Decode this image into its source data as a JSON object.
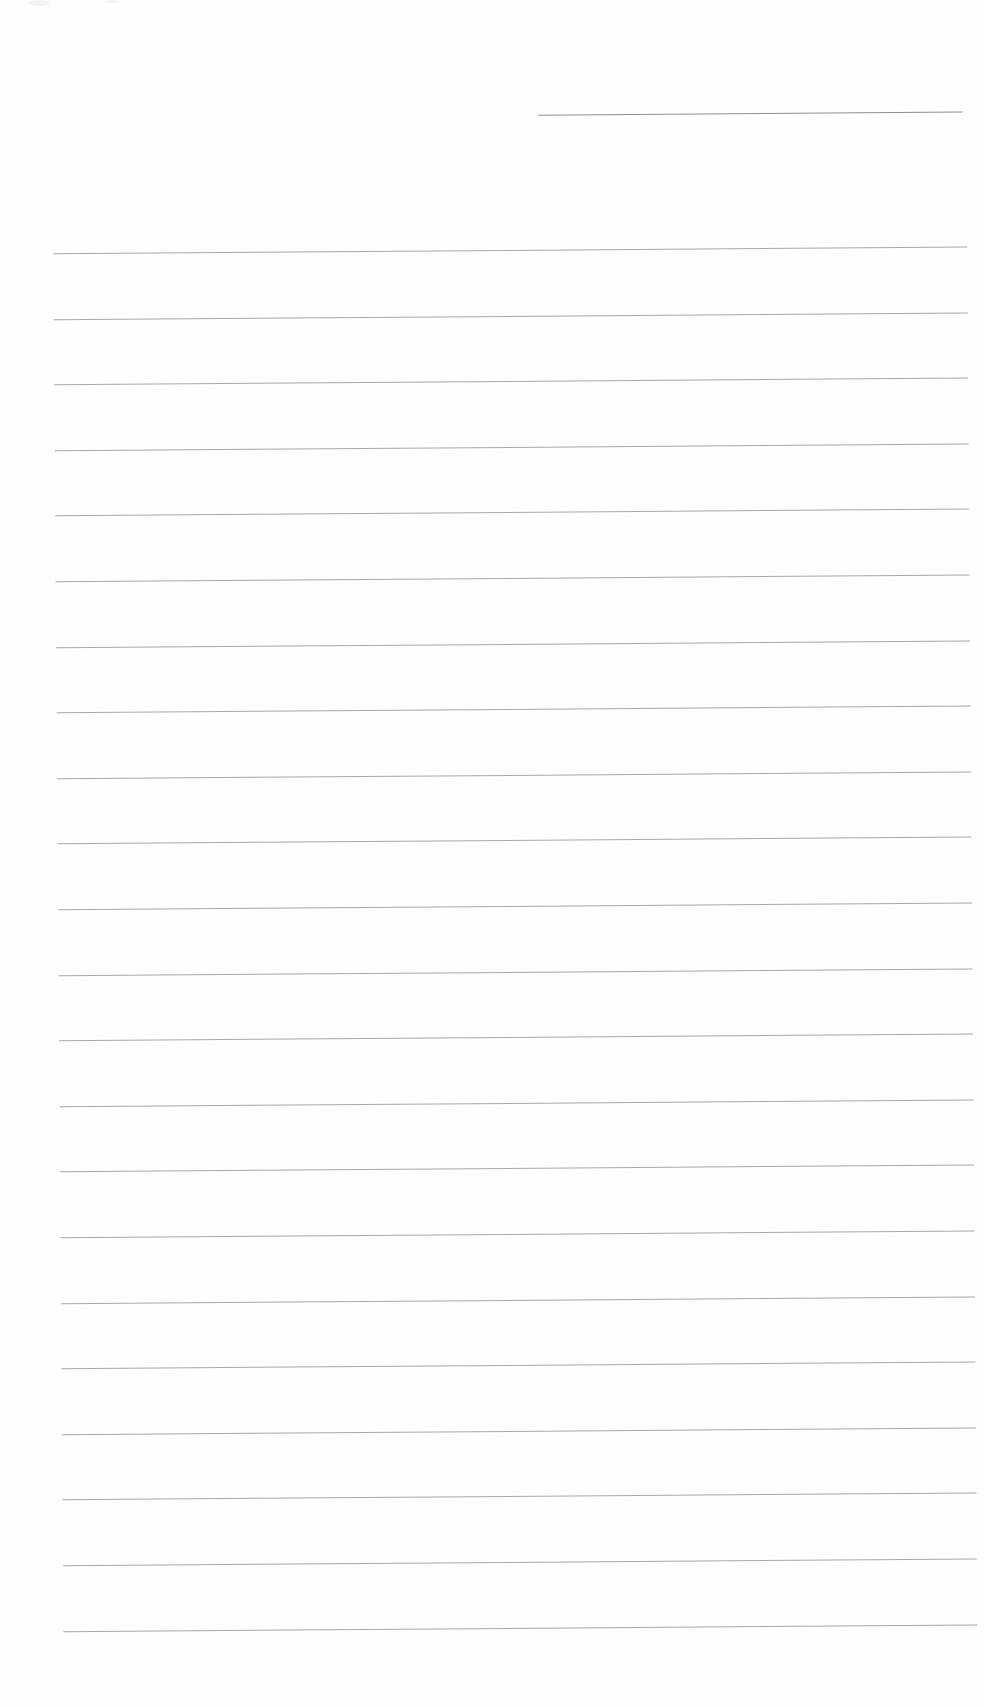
{
  "document": {
    "type": "blank lined paper",
    "header_line": {
      "x": 544,
      "y": 115,
      "width": 424
    },
    "ruled_lines": {
      "count": 22,
      "left": 58,
      "right": 972,
      "first_y": 250,
      "spacing": 65.6
    },
    "colors": {
      "paper": "#fefefe",
      "line": "#9a9a9a"
    }
  }
}
